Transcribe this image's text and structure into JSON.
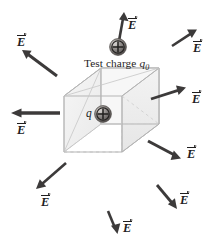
{
  "figure": {
    "background_color": "#ffffff",
    "width": 219,
    "height": 244
  },
  "caption": {
    "text_prefix": "Test charge ",
    "symbol": "q",
    "subscript": "0",
    "full_text": "Test charge q0",
    "x": 84,
    "y": 57
  },
  "charges": [
    {
      "name": "test-charge",
      "label": "",
      "sign": "+",
      "cx": 118,
      "cy": 47,
      "r": 8.5,
      "color": "#8a8684"
    },
    {
      "name": "source-charge",
      "label": "q",
      "sign": "+",
      "cx": 103,
      "cy": 114,
      "r": 8.5,
      "color": "#8a8684"
    }
  ],
  "box": {
    "name": "gaussian-box",
    "fill": "#f4f4f4",
    "stroke": "#b9b9b9",
    "stroke_dashed": "#c8c8c8"
  },
  "field_label": {
    "symbol": "E",
    "vector": true
  },
  "arrows": [
    {
      "name": "field-arrow-up",
      "label": "E",
      "x1": 119,
      "y1": 41,
      "x2": 124,
      "y2": 13,
      "width": 2.6,
      "head": 5.6,
      "label_x": 128,
      "label_y": 19
    },
    {
      "name": "field-arrow-upper-left",
      "label": "E",
      "x1": 57,
      "y1": 76,
      "x2": 23,
      "y2": 51,
      "width": 3.0,
      "head": 6.2,
      "label_x": 17,
      "label_y": 36
    },
    {
      "name": "field-arrow-left",
      "label": "E",
      "x1": 60,
      "y1": 113,
      "x2": 12,
      "y2": 113,
      "width": 3.3,
      "head": 6.6,
      "label_x": 17,
      "label_y": 124
    },
    {
      "name": "field-arrow-lower-left",
      "label": "E",
      "x1": 66,
      "y1": 163,
      "x2": 37,
      "y2": 188,
      "width": 2.6,
      "head": 5.6,
      "label_x": 41,
      "label_y": 196
    },
    {
      "name": "field-arrow-down",
      "label": "E",
      "x1": 108,
      "y1": 211,
      "x2": 117,
      "y2": 233,
      "width": 2.6,
      "head": 5.6,
      "label_x": 123,
      "label_y": 222
    },
    {
      "name": "field-arrow-lower-right",
      "label": "E",
      "x1": 157,
      "y1": 185,
      "x2": 176,
      "y2": 208,
      "width": 2.8,
      "head": 5.8,
      "label_x": 180,
      "label_y": 194
    },
    {
      "name": "field-arrow-right-down",
      "label": "E",
      "x1": 148,
      "y1": 141,
      "x2": 180,
      "y2": 158,
      "width": 3.1,
      "head": 6.4,
      "label_x": 187,
      "label_y": 148
    },
    {
      "name": "field-arrow-right-up",
      "label": "E",
      "x1": 151,
      "y1": 99,
      "x2": 185,
      "y2": 88,
      "width": 2.8,
      "head": 6.0,
      "label_x": 192,
      "label_y": 93
    },
    {
      "name": "field-arrow-upper-right",
      "label": "E",
      "x1": 172,
      "y1": 46,
      "x2": 196,
      "y2": 30,
      "width": 2.6,
      "head": 5.6,
      "label_x": 193,
      "label_y": 42
    }
  ],
  "colors": {
    "arrow": "#3c3a3a",
    "text": "#201e1e",
    "box_face": "#f2f2f2",
    "box_edge": "#b5b5b5",
    "charge_body": "#8f8b89",
    "charge_highlight": "#d5d2d0",
    "charge_shadow": "#5a5654"
  }
}
